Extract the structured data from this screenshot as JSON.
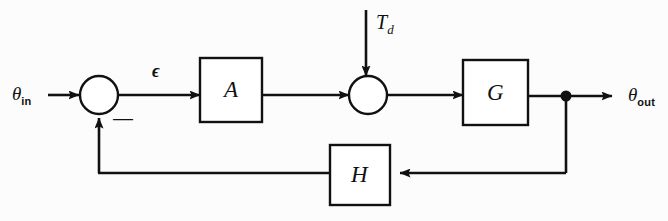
{
  "diagram": {
    "background": "#fcfcfc",
    "line_color": "#111111",
    "labels": {
      "theta_in": "θ",
      "theta_in_sub": "in",
      "theta_out": "θ",
      "theta_out_sub": "out",
      "error": "ϵ",
      "disturbance": "T",
      "disturbance_sub": "d",
      "sign_negative": "—"
    },
    "blocks": [
      {
        "name": "amplifier-block",
        "label": "A",
        "x": 200,
        "y": 58,
        "w": 62,
        "h": 64
      },
      {
        "name": "plant-block",
        "label": "G",
        "x": 463,
        "y": 60,
        "w": 65,
        "h": 65
      },
      {
        "name": "feedback-block",
        "label": "H",
        "x": 330,
        "y": 145,
        "w": 60,
        "h": 60
      }
    ],
    "junctions": [
      {
        "name": "error-summing-junction",
        "cx": 99,
        "cy": 95,
        "r": 19
      },
      {
        "name": "disturbance-summing-junction",
        "cx": 368,
        "cy": 95,
        "r": 19
      }
    ],
    "takeoff_point": {
      "name": "output-takeoff-node",
      "cx": 566,
      "cy": 96,
      "r": 5
    },
    "signal_flow": [
      "theta_in -> error-summing-junction",
      "error-summing-junction -> epsilon -> amplifier-block A",
      "amplifier-block A -> disturbance-summing-junction",
      "T_d -> disturbance-summing-junction",
      "disturbance-summing-junction -> plant-block G",
      "plant-block G -> output-takeoff-node -> theta_out",
      "output-takeoff-node -> feedback-block H -> error-summing-junction (negative)"
    ]
  }
}
